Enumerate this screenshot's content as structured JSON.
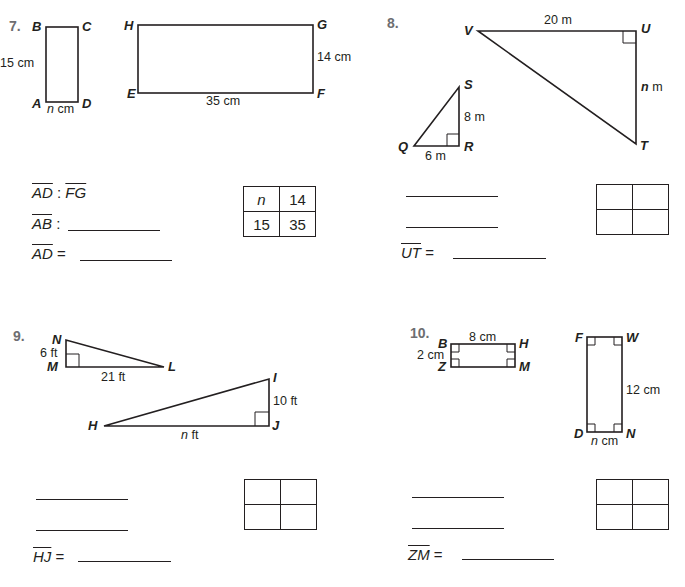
{
  "problems": [
    {
      "number": "7.",
      "figure_small": {
        "vertices": [
          "B",
          "C",
          "A",
          "D"
        ],
        "measures": {
          "left": "15 cm",
          "bottom_var": "n",
          "bottom_unit": "cm"
        }
      },
      "figure_large": {
        "vertices": [
          "H",
          "G",
          "E",
          "F"
        ],
        "measures": {
          "right": "14 cm",
          "bottom": "35 cm"
        }
      },
      "ratio_lines": [
        {
          "left": "AD",
          "sep": " : ",
          "right": "FG"
        },
        {
          "left": "AB",
          "sep": " : ",
          "right": ""
        }
      ],
      "answer": {
        "segment": "AD",
        "eq": " = "
      },
      "proportion_table": [
        [
          "n",
          "14"
        ],
        [
          "15",
          "35"
        ]
      ]
    },
    {
      "number": "8.",
      "figure_small": {
        "vertices": [
          "S",
          "Q",
          "R"
        ],
        "measures": {
          "vertical": "8 m",
          "horizontal": "6 m"
        }
      },
      "figure_large": {
        "vertices": [
          "V",
          "U",
          "T"
        ],
        "measures": {
          "top": "20 m",
          "right_var": "n",
          "right_unit": "m"
        }
      },
      "answer": {
        "segment": "UT",
        "eq": " = "
      },
      "proportion_table": [
        [
          "",
          ""
        ],
        [
          "",
          ""
        ]
      ]
    },
    {
      "number": "9.",
      "figure_small": {
        "vertices": [
          "N",
          "M",
          "L"
        ],
        "measures": {
          "vertical": "6 ft",
          "horizontal": "21 ft"
        }
      },
      "figure_large": {
        "vertices": [
          "I",
          "H",
          "J"
        ],
        "measures": {
          "vertical": "10 ft",
          "horizontal_var": "n",
          "horizontal_unit": "ft"
        }
      },
      "answer": {
        "segment": "HJ",
        "eq": " = "
      },
      "proportion_table": [
        [
          "",
          ""
        ],
        [
          "",
          ""
        ]
      ]
    },
    {
      "number": "10.",
      "figure_small": {
        "vertices": [
          "B",
          "H",
          "Z",
          "M"
        ],
        "measures": {
          "top": "8 cm",
          "left": "2 cm"
        }
      },
      "figure_large": {
        "vertices": [
          "F",
          "W",
          "D",
          "N"
        ],
        "measures": {
          "right": "12 cm",
          "bottom_var": "n",
          "bottom_unit": "cm"
        }
      },
      "answer": {
        "segment": "ZM",
        "eq": " = "
      },
      "proportion_table": [
        [
          "",
          ""
        ],
        [
          "",
          ""
        ]
      ]
    }
  ]
}
